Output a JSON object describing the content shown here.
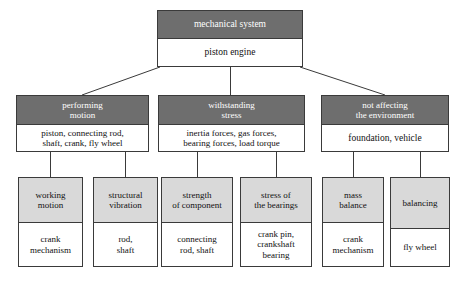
{
  "diagram": {
    "type": "hierarchy-tree",
    "colors": {
      "header_dark": "#6e6e6e",
      "header_light": "#d9d9d9",
      "box_fill": "#ffffff",
      "border": "#3a3a3a",
      "text_on_dark": "#ffffff",
      "text_on_light": "#111111"
    },
    "root": {
      "header": "mechanical system",
      "body": "piston engine"
    },
    "branches": [
      {
        "header": "performing\nmotion",
        "body": "piston, connecting rod,\nshaft, crank, fly wheel"
      },
      {
        "header": "withstanding\nstress",
        "body": "inertia forces, gas forces,\nbearing forces, load torque"
      },
      {
        "header": "not affecting\nthe environment",
        "body": "foundation, vehicle"
      }
    ],
    "leaves": [
      {
        "header": "working\nmotion",
        "body": "crank\nmechanism"
      },
      {
        "header": "structural\nvibration",
        "body": "rod,\nshaft"
      },
      {
        "header": "strength\nof component",
        "body": "connecting\nrod, shaft"
      },
      {
        "header": "stress of\nthe bearings",
        "body": "crank pin,\ncrankshaft\nbearing"
      },
      {
        "header": "mass\nbalance",
        "body": "crank\nmechanism"
      },
      {
        "header": "balancing",
        "body": "fly wheel"
      }
    ]
  }
}
